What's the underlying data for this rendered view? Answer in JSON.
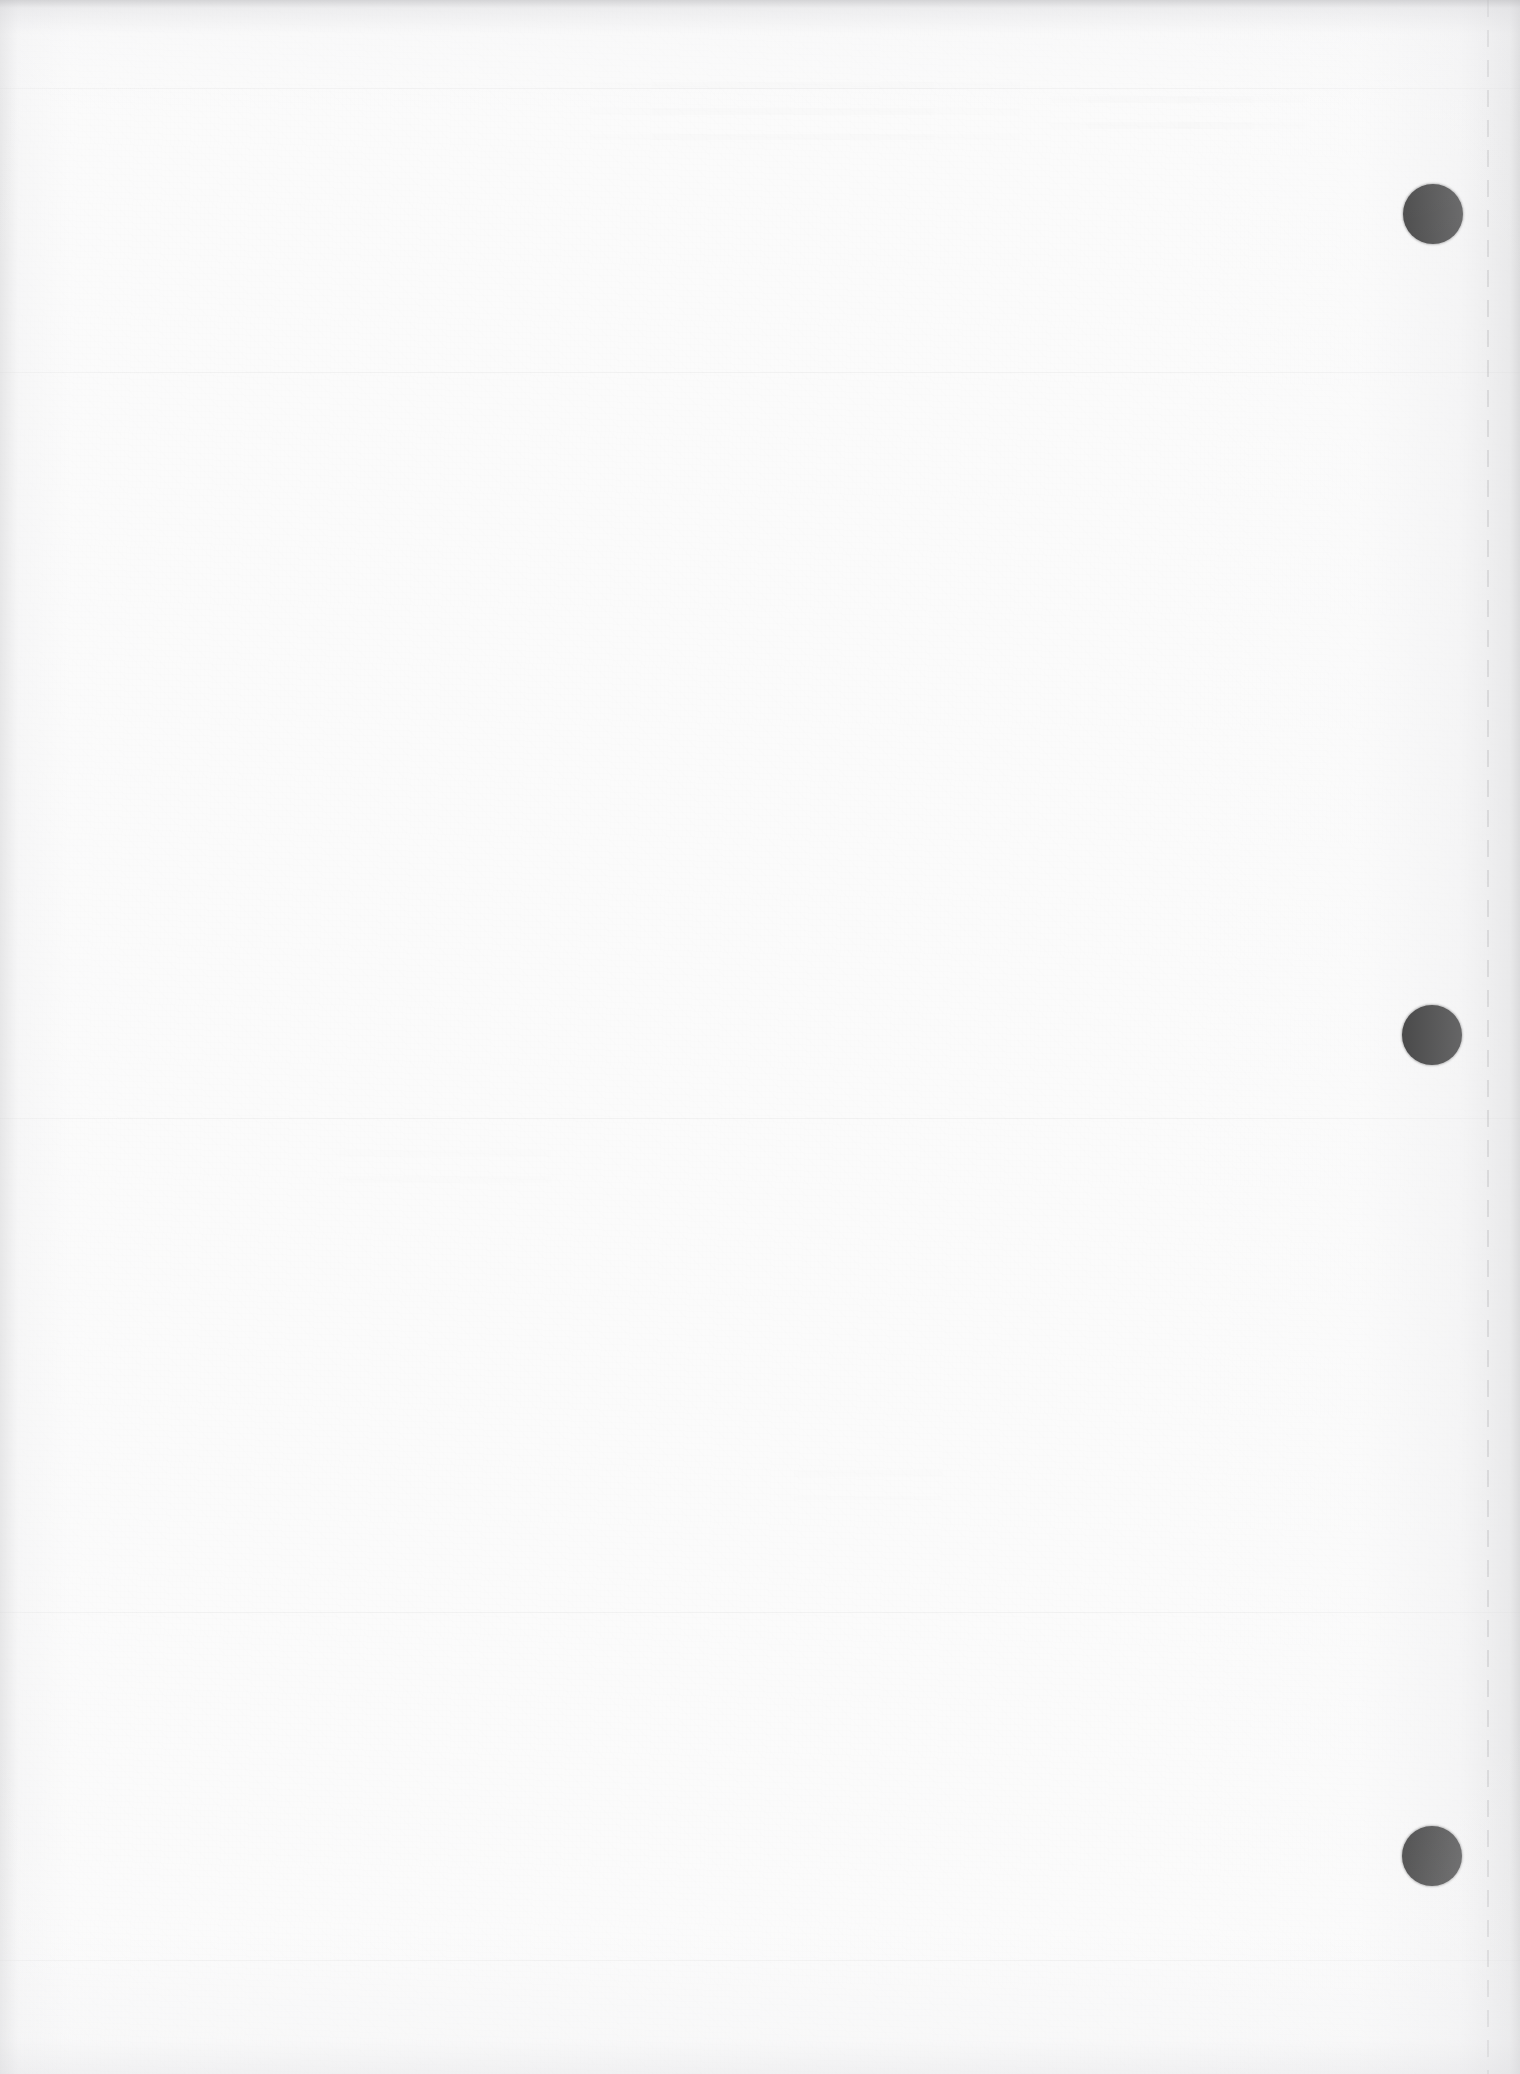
{
  "document": {
    "kind": "scanned-page",
    "page_state": "blank",
    "page_width": 1520,
    "page_height": 2074,
    "paper_color": "#fbfbfb",
    "ink_color": "#0b0b0b",
    "edge_shadow_color": "#c4c4c7"
  },
  "margin_marks": {
    "label": "registration dots",
    "count": 3,
    "color": "#0b0b0b",
    "diameter": 60,
    "dots": [
      {
        "name": "registration-dot-top",
        "cx": 1433,
        "cy": 214,
        "d": 60
      },
      {
        "name": "registration-dot-middle",
        "cx": 1432,
        "cy": 1035,
        "d": 60
      },
      {
        "name": "registration-dot-bottom",
        "cx": 1432,
        "cy": 1856,
        "d": 60
      }
    ]
  },
  "perforation": {
    "label": "dashed fold line",
    "x": 1487,
    "color": "#78787c",
    "dash_length": 17,
    "dash_gap": 13
  },
  "creases": [
    {
      "y": 88
    },
    {
      "y": 372
    },
    {
      "y": 1118
    },
    {
      "y": 1612
    },
    {
      "y": 1960
    }
  ],
  "content": {
    "body_text": "",
    "note": "No printed text content is visible on this page."
  }
}
